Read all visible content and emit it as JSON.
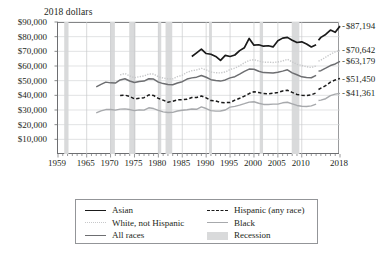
{
  "axis_note": "2018 dollars",
  "colors": {
    "asian": "#1a1a1a",
    "white_not_hispanic": "#c7c8ca",
    "all_races": "#6d6e71",
    "hispanic": "#1a1a1a",
    "black": "#a7a9ac",
    "recession": "#d9dadb",
    "axis": "#6d6e71"
  },
  "y_axis": {
    "labels": [
      "$90,000",
      "$80,000",
      "$70,000",
      "$60,000",
      "$50,000",
      "$40,000",
      "$30,000",
      "$20,000",
      "$10,000"
    ],
    "min": 0,
    "max": 90000,
    "step": 10000
  },
  "x_axis": {
    "labels": [
      "1959",
      "1965",
      "1970",
      "1975",
      "1980",
      "1985",
      "1990",
      "1995",
      "2000",
      "2005",
      "2010",
      "2018"
    ],
    "min": 1959,
    "max": 2018
  },
  "end_labels": [
    {
      "text": "$87,194",
      "value": 87194,
      "series": "Asian"
    },
    {
      "text": "$70,642",
      "value": 70642,
      "series": "White, not Hispanic"
    },
    {
      "text": "$63,179",
      "value": 63179,
      "series": "All races"
    },
    {
      "text": "$51,450",
      "value": 51450,
      "series": "Hispanic (any race)"
    },
    {
      "text": "$41,361",
      "value": 41361,
      "series": "Black"
    }
  ],
  "legend": {
    "left": [
      {
        "label": "Asian",
        "style": "solid-dark"
      },
      {
        "label": "White, not Hispanic",
        "style": "dotted-light"
      },
      {
        "label": "All races",
        "style": "solid-medium"
      }
    ],
    "right": [
      {
        "label": "Hispanic (any race)",
        "style": "dashed-dark"
      },
      {
        "label": "Black",
        "style": "solid-gray"
      },
      {
        "label": "Recession",
        "style": "band"
      }
    ]
  },
  "chart_data": {
    "type": "line",
    "title": "",
    "subtitle": "",
    "xlabel": "",
    "ylabel": "2018 dollars",
    "xlim": [
      1959,
      2018
    ],
    "ylim": [
      0,
      90000
    ],
    "grid": true,
    "legend_position": "bottom",
    "recessions": [
      {
        "start": 1960.3,
        "end": 1961.2
      },
      {
        "start": 1969.9,
        "end": 1970.9
      },
      {
        "start": 1973.9,
        "end": 1975.2
      },
      {
        "start": 1980.0,
        "end": 1980.6
      },
      {
        "start": 1981.5,
        "end": 1982.9
      },
      {
        "start": 1990.6,
        "end": 1991.2
      },
      {
        "start": 2001.2,
        "end": 2001.9
      },
      {
        "start": 2007.9,
        "end": 2009.5
      }
    ],
    "series": [
      {
        "name": "All races",
        "style": "solid-medium",
        "color": "#6d6e71",
        "x": [
          1967,
          1968,
          1969,
          1970,
          1971,
          1972,
          1973,
          1974,
          1975,
          1976,
          1977,
          1978,
          1979,
          1980,
          1981,
          1982,
          1983,
          1984,
          1985,
          1986,
          1987,
          1988,
          1989,
          1990,
          1991,
          1992,
          1993,
          1994,
          1995,
          1996,
          1997,
          1998,
          1999,
          2000,
          2001,
          2002,
          2003,
          2004,
          2005,
          2006,
          2007,
          2008,
          2009,
          2010,
          2011,
          2012,
          2013,
          2013.5,
          2014,
          2015,
          2016,
          2017,
          2018
        ],
        "values": [
          45800,
          47500,
          49000,
          48500,
          48400,
          50500,
          51300,
          49800,
          48700,
          49400,
          49700,
          51300,
          51100,
          49000,
          48000,
          47400,
          47200,
          48400,
          49300,
          51100,
          51900,
          52400,
          53500,
          52300,
          50700,
          50100,
          49700,
          50500,
          51900,
          52700,
          54400,
          56300,
          57900,
          57800,
          56400,
          55500,
          55400,
          55300,
          55800,
          56500,
          57400,
          55300,
          54000,
          52600,
          52100,
          52000,
          53600,
          56500,
          56800,
          58500,
          60300,
          61400,
          63179
        ]
      },
      {
        "name": "White, not Hispanic",
        "style": "dotted-light",
        "color": "#c7c8ca",
        "x": [
          1972,
          1973,
          1974,
          1975,
          1976,
          1977,
          1978,
          1979,
          1980,
          1981,
          1982,
          1983,
          1984,
          1985,
          1986,
          1987,
          1988,
          1989,
          1990,
          1991,
          1992,
          1993,
          1994,
          1995,
          1996,
          1997,
          1998,
          1999,
          2000,
          2001,
          2002,
          2003,
          2004,
          2005,
          2006,
          2007,
          2008,
          2009,
          2010,
          2011,
          2012,
          2013,
          2013.5,
          2014,
          2015,
          2016,
          2017,
          2018
        ],
        "values": [
          54000,
          54900,
          53200,
          52000,
          52700,
          53200,
          54600,
          54500,
          52700,
          51800,
          51200,
          51200,
          52800,
          53700,
          55700,
          56800,
          57300,
          58400,
          57300,
          55900,
          55400,
          55300,
          55900,
          57600,
          58500,
          60100,
          62200,
          63800,
          64300,
          63400,
          62600,
          62600,
          62400,
          62700,
          63400,
          64600,
          62800,
          61100,
          60400,
          59500,
          59000,
          60000,
          63300,
          64000,
          66000,
          68000,
          69600,
          70642
        ]
      },
      {
        "name": "Black",
        "style": "solid-gray",
        "color": "#a7a9ac",
        "x": [
          1967,
          1968,
          1969,
          1970,
          1971,
          1972,
          1973,
          1974,
          1975,
          1976,
          1977,
          1978,
          1979,
          1980,
          1981,
          1982,
          1983,
          1984,
          1985,
          1986,
          1987,
          1988,
          1989,
          1990,
          1991,
          1992,
          1993,
          1994,
          1995,
          1996,
          1997,
          1998,
          1999,
          2000,
          2001,
          2002,
          2003,
          2004,
          2005,
          2006,
          2007,
          2008,
          2009,
          2010,
          2011,
          2012,
          2013,
          2013.5,
          2014,
          2015,
          2016,
          2017,
          2018
        ],
        "values": [
          28000,
          29400,
          30300,
          30300,
          29900,
          30600,
          30800,
          30300,
          29600,
          30100,
          29900,
          31500,
          31000,
          29700,
          28700,
          28300,
          28400,
          29300,
          29800,
          30200,
          30700,
          30500,
          32100,
          31000,
          29600,
          29200,
          29300,
          30000,
          32000,
          32500,
          33300,
          34300,
          35400,
          35600,
          34600,
          33800,
          33800,
          34000,
          34000,
          34900,
          35300,
          34200,
          33100,
          32600,
          32400,
          32800,
          34000,
          36500,
          36700,
          37700,
          39800,
          40800,
          41361
        ]
      },
      {
        "name": "Hispanic (any race)",
        "style": "dashed-dark",
        "color": "#1a1a1a",
        "x": [
          1972,
          1973,
          1974,
          1975,
          1976,
          1977,
          1978,
          1979,
          1980,
          1981,
          1982,
          1983,
          1984,
          1985,
          1986,
          1987,
          1988,
          1989,
          1990,
          1991,
          1992,
          1993,
          1994,
          1995,
          1996,
          1997,
          1998,
          1999,
          2000,
          2001,
          2002,
          2003,
          2004,
          2005,
          2006,
          2007,
          2008,
          2009,
          2010,
          2011,
          2012,
          2013,
          2013.5,
          2014,
          2015,
          2016,
          2017,
          2018
        ],
        "values": [
          39900,
          40100,
          39300,
          37600,
          38000,
          38400,
          40300,
          39900,
          37900,
          36700,
          35300,
          36000,
          36900,
          37000,
          37300,
          38500,
          38500,
          39500,
          38300,
          36400,
          36100,
          35200,
          35000,
          35100,
          36700,
          38000,
          39500,
          41200,
          42400,
          41900,
          41200,
          41000,
          41400,
          42000,
          43000,
          43500,
          42000,
          40600,
          40100,
          39800,
          40300,
          41700,
          44000,
          44900,
          46600,
          49000,
          50500,
          51450
        ]
      },
      {
        "name": "Asian",
        "style": "solid-dark",
        "color": "#1a1a1a",
        "x": [
          1987,
          1988,
          1989,
          1990,
          1991,
          1992,
          1993,
          1994,
          1995,
          1996,
          1997,
          1998,
          1999,
          2000,
          2001,
          2002,
          2003,
          2004,
          2005,
          2006,
          2007,
          2008,
          2009,
          2010,
          2011,
          2012,
          2013,
          2013.5,
          2014,
          2015,
          2016,
          2017,
          2018
        ],
        "values": [
          66500,
          69000,
          71500,
          68500,
          68000,
          66500,
          63800,
          67200,
          66500,
          67500,
          70500,
          72500,
          78800,
          74200,
          74500,
          73500,
          73800,
          73000,
          77200,
          79000,
          79500,
          77500,
          76000,
          76500,
          75000,
          73000,
          74500,
          77500,
          79500,
          81500,
          84500,
          83000,
          87194
        ]
      }
    ]
  }
}
